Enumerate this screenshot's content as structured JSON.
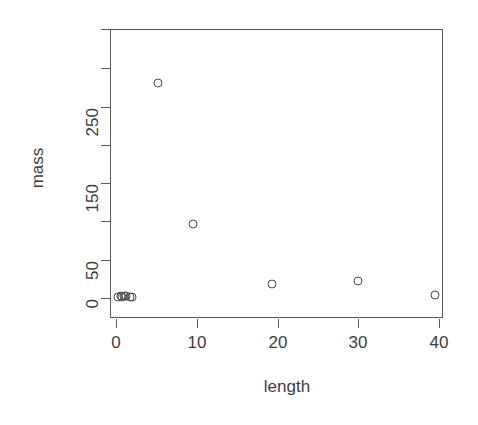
{
  "chart_data": {
    "type": "scatter",
    "title": "",
    "xlabel": "length",
    "ylabel": "mass",
    "xlim": [
      -1.1,
      40.0
    ],
    "ylim": [
      -4,
      294
    ],
    "grid": false,
    "legend": null,
    "x_ticks": [
      {
        "value": 0,
        "label": "0"
      },
      {
        "value": 10,
        "label": "10"
      },
      {
        "value": 20,
        "label": "20"
      },
      {
        "value": 30,
        "label": "30"
      },
      {
        "value": 40,
        "label": "40"
      }
    ],
    "y_ticks": [
      {
        "value": 0,
        "label": "0"
      },
      {
        "value": 50,
        "label": "50"
      },
      {
        "value": 100,
        "label": ""
      },
      {
        "value": 150,
        "label": "150"
      },
      {
        "value": 200,
        "label": ""
      },
      {
        "value": 250,
        "label": "250"
      },
      {
        "value": 300,
        "label": ""
      }
    ],
    "points": [
      {
        "x": 0.3,
        "y": 1
      },
      {
        "x": 0.6,
        "y": 2
      },
      {
        "x": 0.8,
        "y": 1
      },
      {
        "x": 1.0,
        "y": 3
      },
      {
        "x": 1.3,
        "y": 2
      },
      {
        "x": 1.7,
        "y": 1
      },
      {
        "x": 2.0,
        "y": 1
      },
      {
        "x": 5.2,
        "y": 282
      },
      {
        "x": 9.5,
        "y": 97
      },
      {
        "x": 19.3,
        "y": 18
      },
      {
        "x": 30.0,
        "y": 22
      },
      {
        "x": 39.5,
        "y": 4
      }
    ],
    "marker": "open-circle",
    "marker_color": "#4a4a4a",
    "background": "#ffffff"
  },
  "axes": {
    "x_title": "length",
    "y_title": "mass"
  }
}
